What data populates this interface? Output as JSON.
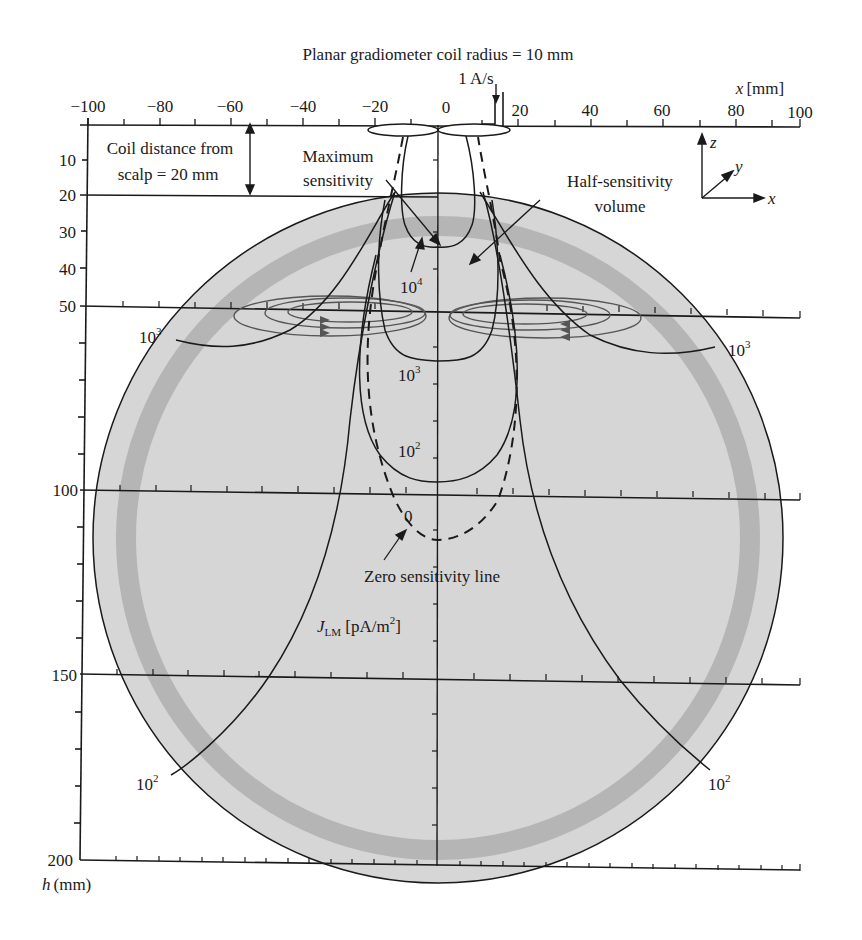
{
  "title": "Planar gradiometer coil radius = 10 mm",
  "current_label": "1 A/s",
  "x_axis": {
    "label_var": "x",
    "label_unit": "[mm]",
    "ticks": [
      "−100",
      "−80",
      "−60",
      "−40",
      "−20",
      "0",
      "20",
      "40",
      "60",
      "80",
      "100"
    ]
  },
  "h_axis": {
    "label_var": "h",
    "label_unit": "(mm)",
    "ticks": [
      "10",
      "20",
      "30",
      "40",
      "50",
      "100",
      "150",
      "200"
    ]
  },
  "annotations": {
    "coil_distance_line1": "Coil distance from",
    "coil_distance_line2": "scalp = 20 mm",
    "max_sensitivity_line1": "Maximum",
    "max_sensitivity_line2": "sensitivity",
    "half_sensitivity_line1": "Half-sensitivity",
    "half_sensitivity_line2": "volume",
    "zero_line": "Zero sensitivity line",
    "zero_value": "0",
    "unit_main": "J",
    "unit_sub": "LM",
    "unit_rest": " [pA/m",
    "unit_exp": "2",
    "unit_close": "]"
  },
  "contour_labels": {
    "c1e4": {
      "base": "10",
      "exp": "4"
    },
    "c1e3_center": {
      "base": "10",
      "exp": "3"
    },
    "c1e2_center": {
      "base": "10",
      "exp": "2"
    },
    "c1e3_left": {
      "base": "10",
      "exp": "3"
    },
    "c1e3_right": {
      "base": "10",
      "exp": "3"
    },
    "c1e2_left": {
      "base": "10",
      "exp": "2"
    },
    "c1e2_right": {
      "base": "10",
      "exp": "2"
    }
  },
  "axes_triad": {
    "z": "z",
    "y": "y",
    "x": "x"
  },
  "colors": {
    "head_fill": "#d6d6d6",
    "skull_band": "#b5b5b5",
    "line": "#1a1a1a",
    "flux_loops": "#555555"
  },
  "diagram": {
    "type": "sensitivity-contour-diagram",
    "coil_radius_mm": 10,
    "coil_to_scalp_mm": 20,
    "current_rate": "1 A/s",
    "contour_levels_pA_per_m2": [
      10000,
      1000,
      100,
      0
    ],
    "horizontal_gridlines_h_mm": [
      0,
      20,
      50,
      100,
      150,
      200
    ]
  }
}
